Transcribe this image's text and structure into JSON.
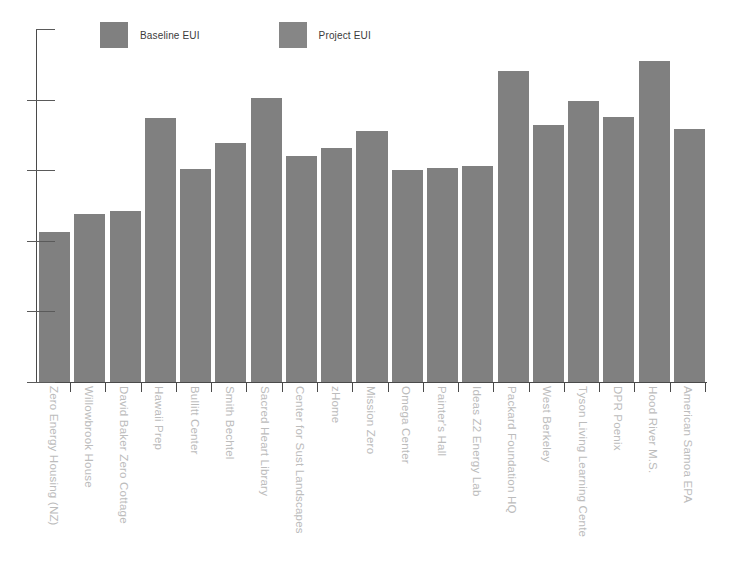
{
  "chart_data": {
    "type": "bar",
    "title": "",
    "xlabel": "",
    "ylabel": "",
    "ylim": [
      0,
      100
    ],
    "yticks": [
      0,
      20,
      40,
      60,
      80,
      100
    ],
    "grid": false,
    "legend_position": "top-left",
    "bar_color": "#808080",
    "categories": [
      "Zero Energy Housing (NZ)",
      "Willowbrook House",
      "David Baker Zero Cottage",
      "Hawaii Prep",
      "Bullitt Center",
      "Smith Bechtel",
      "Sacred Heart Library",
      "Center for Sust Landscapes",
      "zHome",
      "Mission Zero",
      "Omega Center",
      "Painter's Hall",
      "Ideas Z2 Energy Lab",
      "Packard Foundation HQ",
      "West Berkeley",
      "Tyson Living Learning Cente",
      "DPR Poenix",
      "Hood River M.S.",
      "American Samoa EPA"
    ],
    "series": [
      {
        "name": "Baseline EUI",
        "color": "#808080",
        "values": [
          42.5,
          47.5,
          48.5,
          74.8,
          60.3,
          67.8,
          80.5,
          64.0,
          66.3,
          71.0,
          60.1,
          60.5,
          61.3,
          88.0,
          72.8,
          79.5,
          75.2,
          91.0,
          71.8
        ]
      }
    ]
  },
  "legend": {
    "entries": [
      {
        "label": "Baseline EUI",
        "color": "#808080",
        "swatch_name": "legend-swatch-baseline"
      },
      {
        "label": "Project EUI",
        "color": "#868686",
        "swatch_name": "legend-swatch-project"
      }
    ]
  },
  "axes": {
    "y_tick_labels": [
      "100",
      "80",
      "60",
      "40",
      "20",
      "0"
    ]
  }
}
